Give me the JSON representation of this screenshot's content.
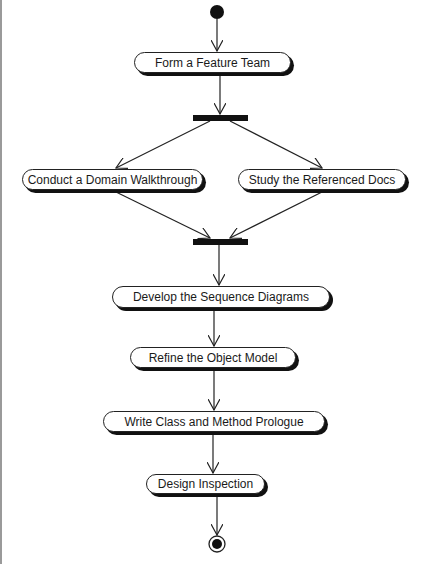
{
  "diagram": {
    "type": "UML activity diagram",
    "start_node": {
      "label": "initial-node"
    },
    "activities": [
      {
        "id": "form-team",
        "label": "Form a Feature Team"
      },
      {
        "id": "domain-walkthrough",
        "label": "Conduct a Domain Walkthrough"
      },
      {
        "id": "study-docs",
        "label": "Study the Referenced Docs"
      },
      {
        "id": "sequence-diagrams",
        "label": "Develop the Sequence Diagrams"
      },
      {
        "id": "object-model",
        "label": "Refine the Object Model"
      },
      {
        "id": "class-prologue",
        "label": "Write Class and Method Prologue"
      },
      {
        "id": "design-inspection",
        "label": "Design Inspection"
      }
    ],
    "fork_bar": {
      "label": "fork"
    },
    "join_bar": {
      "label": "join"
    },
    "end_node": {
      "label": "final-node"
    },
    "colors": {
      "line": "#222222",
      "fill": "#ffffff",
      "bar": "#111111",
      "shadow": "#111111"
    }
  }
}
